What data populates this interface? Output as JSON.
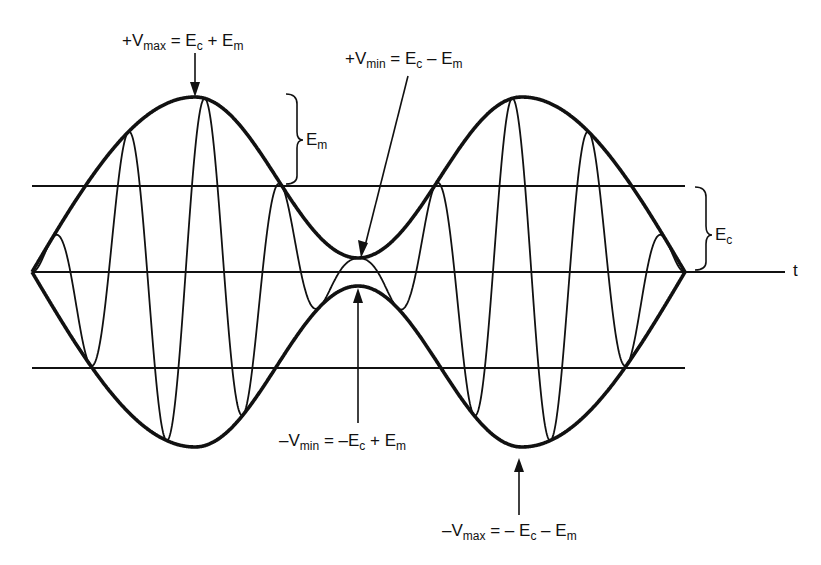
{
  "figure": {
    "time_axis_label": "t",
    "labels": {
      "pos_vmax": {
        "sign": "+",
        "V": "V",
        "sub": "max",
        "eq": " = E",
        "s1": "c",
        "op": " + E",
        "s2": "m"
      },
      "pos_vmin": {
        "sign": "+",
        "V": "V",
        "sub": "min",
        "eq": " = E",
        "s1": "c",
        "op": " – E",
        "s2": "m"
      },
      "neg_vmin": {
        "sign": "–",
        "V": "V",
        "sub": "min",
        "eq": " = –E",
        "s1": "c",
        "op": " + E",
        "s2": "m"
      },
      "neg_vmax": {
        "sign": "–",
        "V": "V",
        "sub": "max",
        "eq": " = – E",
        "s1": "c",
        "op": " – E",
        "s2": "m"
      },
      "em": {
        "main": "E",
        "sub": "m"
      },
      "ec": {
        "main": "E",
        "sub": "c"
      }
    },
    "colors": {
      "stroke": "#111111",
      "background": "#ffffff"
    }
  },
  "geometry": {
    "axis_y": 272,
    "upper_ref_y": 186,
    "lower_ref_y": 368,
    "x_start": 32,
    "x_end": 685,
    "axis_end": 785,
    "envelope_points": [
      [
        32,
        0
      ],
      [
        195,
        175
      ],
      [
        358,
        14
      ],
      [
        522,
        175
      ],
      [
        685,
        0
      ]
    ],
    "carrier_cycles": 8.5
  }
}
